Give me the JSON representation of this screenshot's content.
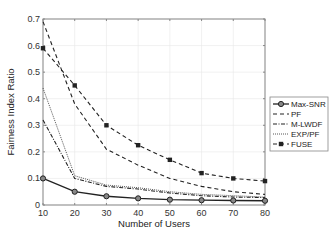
{
  "chart_data": {
    "type": "line",
    "title": "",
    "xlabel": "Number of Users",
    "ylabel": "Fairness Index Ratio",
    "x": [
      10,
      20,
      30,
      40,
      50,
      60,
      70,
      80
    ],
    "xlim": [
      10,
      80
    ],
    "ylim": [
      0,
      0.7
    ],
    "xticks": [
      "10",
      "20",
      "30",
      "40",
      "50",
      "60",
      "70",
      "80"
    ],
    "yticks": [
      "0",
      "0.1",
      "0.2",
      "0.3",
      "0.4",
      "0.5",
      "0.6",
      "0.7"
    ],
    "grid": true,
    "legend_position": "right-outside",
    "series": [
      {
        "name": "Max-SNR",
        "style": "solid-circle",
        "values": [
          0.1,
          0.05,
          0.033,
          0.025,
          0.02,
          0.018,
          0.017,
          0.016
        ]
      },
      {
        "name": "PF",
        "style": "dashed",
        "values": [
          0.69,
          0.38,
          0.21,
          0.15,
          0.1,
          0.07,
          0.05,
          0.04
        ]
      },
      {
        "name": "M-LWDF",
        "style": "dash-dot",
        "values": [
          0.32,
          0.1,
          0.07,
          0.06,
          0.045,
          0.035,
          0.03,
          0.028
        ]
      },
      {
        "name": "EXP/PF",
        "style": "dotted",
        "values": [
          0.44,
          0.11,
          0.075,
          0.065,
          0.05,
          0.04,
          0.035,
          0.03
        ]
      },
      {
        "name": "FUSE",
        "style": "dashed-square",
        "values": [
          0.59,
          0.45,
          0.3,
          0.225,
          0.17,
          0.12,
          0.1,
          0.09
        ]
      }
    ]
  }
}
